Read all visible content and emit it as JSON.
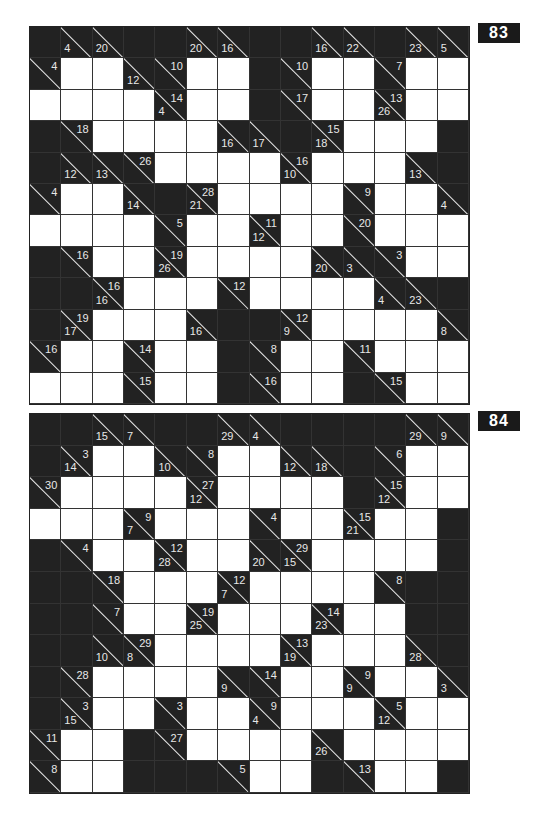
{
  "page": {
    "background": "#ffffff"
  },
  "puzzles": [
    {
      "number": "83",
      "columns": 14,
      "rows": [
        [
          "B",
          "d4",
          "d20",
          "B",
          "B",
          "d20",
          "d16",
          "B",
          "B",
          "d16",
          "d22",
          "B",
          "d23",
          "d5"
        ],
        [
          "a4",
          "W",
          "W",
          "d12",
          "a10",
          "W",
          "W",
          "B",
          "a10",
          "W",
          "W",
          "a7",
          "W",
          "W"
        ],
        [
          "W",
          "W",
          "W",
          "W",
          "d4/a14",
          "W",
          "W",
          "B",
          "a17",
          "W",
          "W",
          "d26/a13",
          "W",
          "W"
        ],
        [
          "B",
          "a18",
          "W",
          "W",
          "W",
          "W",
          "d16",
          "d17",
          "B",
          "d18/a15",
          "W",
          "W",
          "W",
          "B"
        ],
        [
          "B",
          "d12",
          "d13",
          "a26",
          "W",
          "W",
          "W",
          "W",
          "d10/a16",
          "W",
          "W",
          "W",
          "d13",
          "B"
        ],
        [
          "a4",
          "W",
          "W",
          "d14",
          "B",
          "d21/a28",
          "W",
          "W",
          "W",
          "W",
          "a9",
          "W",
          "W",
          "d4"
        ],
        [
          "W",
          "W",
          "W",
          "W",
          "a5",
          "W",
          "W",
          "d12/a11",
          "W",
          "W",
          "a20",
          "W",
          "W",
          "W"
        ],
        [
          "B",
          "a16",
          "W",
          "W",
          "d26/a19",
          "W",
          "W",
          "W",
          "W",
          "d20",
          "d3",
          "a3",
          "W",
          "W"
        ],
        [
          "B",
          "B",
          "d16/a16",
          "W",
          "W",
          "W",
          "a12",
          "W",
          "W",
          "W",
          "W",
          "d4",
          "d23",
          "B"
        ],
        [
          "B",
          "d17/a19",
          "W",
          "W",
          "W",
          "d16",
          "B",
          "B",
          "d9/a12",
          "W",
          "W",
          "W",
          "W",
          "d8"
        ],
        [
          "a16",
          "W",
          "W",
          "a14",
          "W",
          "W",
          "B",
          "a8",
          "W",
          "W",
          "a11",
          "W",
          "W",
          "W"
        ],
        [
          "W",
          "W",
          "W",
          "a15",
          "W",
          "W",
          "B",
          "a16",
          "W",
          "W",
          "B",
          "a15",
          "W",
          "W"
        ]
      ]
    },
    {
      "number": "84",
      "columns": 14,
      "rows": [
        [
          "B",
          "B",
          "d15",
          "d7",
          "B",
          "B",
          "d29",
          "d4",
          "B",
          "B",
          "B",
          "B",
          "d29",
          "d9"
        ],
        [
          "B",
          "d14/a3",
          "W",
          "W",
          "d10",
          "a8",
          "W",
          "W",
          "d12",
          "d18",
          "B",
          "a6",
          "W",
          "W"
        ],
        [
          "a30",
          "W",
          "W",
          "W",
          "W",
          "d12/a27",
          "W",
          "W",
          "W",
          "W",
          "B",
          "d12/a15",
          "W",
          "W"
        ],
        [
          "W",
          "W",
          "W",
          "d7/a9",
          "W",
          "W",
          "W",
          "a4",
          "W",
          "W",
          "d21/a15",
          "W",
          "W",
          "B"
        ],
        [
          "B",
          "a4",
          "W",
          "W",
          "d28/a12",
          "W",
          "W",
          "d20",
          "d15/a29",
          "W",
          "W",
          "W",
          "W",
          "B"
        ],
        [
          "B",
          "B",
          "a18",
          "W",
          "W",
          "W",
          "d7/a12",
          "W",
          "W",
          "W",
          "W",
          "a8",
          "B",
          "B"
        ],
        [
          "B",
          "B",
          "a7",
          "W",
          "W",
          "d25/a19",
          "W",
          "W",
          "W",
          "d23/a14",
          "W",
          "W",
          "B",
          "B"
        ],
        [
          "B",
          "B",
          "d10",
          "d8/a29",
          "W",
          "W",
          "W",
          "W",
          "d19/a13",
          "W",
          "W",
          "W",
          "d28",
          "B"
        ],
        [
          "B",
          "a28",
          "W",
          "W",
          "W",
          "W",
          "d9",
          "a14",
          "W",
          "W",
          "d9/a9",
          "W",
          "W",
          "d3"
        ],
        [
          "B",
          "d15/a3",
          "W",
          "W",
          "a3",
          "W",
          "W",
          "d4/a9",
          "W",
          "W",
          "W",
          "d12/a5",
          "W",
          "W"
        ],
        [
          "a11",
          "W",
          "W",
          "B",
          "a27",
          "W",
          "W",
          "W",
          "W",
          "d26",
          "W",
          "W",
          "W",
          "W"
        ],
        [
          "a8",
          "W",
          "W",
          "B",
          "B",
          "B",
          "a5",
          "W",
          "W",
          "B",
          "a13",
          "W",
          "W",
          "B"
        ]
      ]
    }
  ]
}
